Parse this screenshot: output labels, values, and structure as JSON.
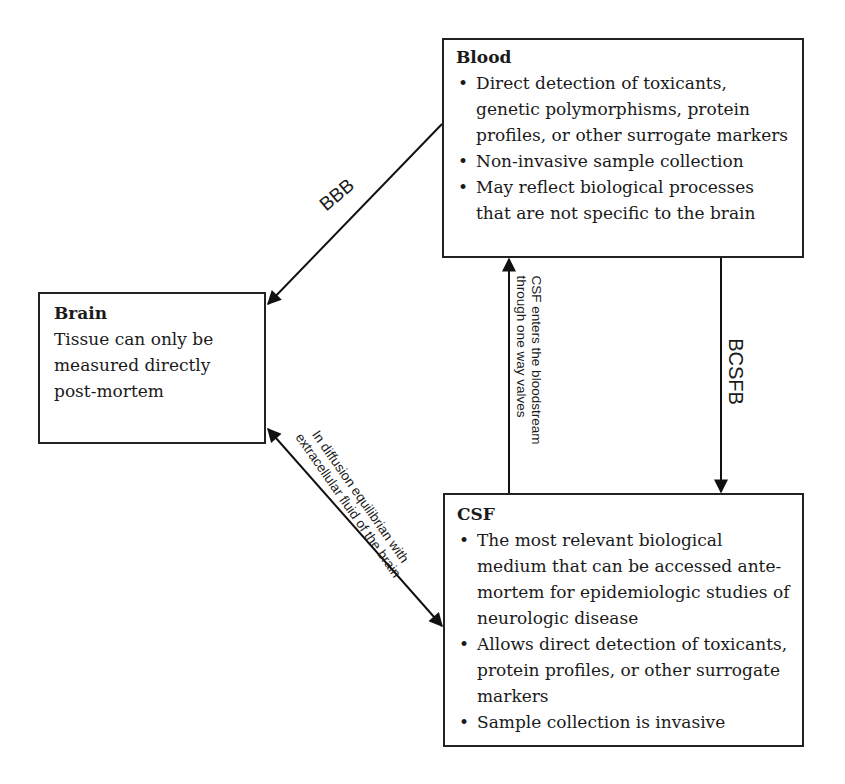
{
  "nodes": {
    "blood": {
      "title": "Blood",
      "bullets": [
        "Direct detection of toxicants, genetic polymorphisms, protein profiles, or other surrogate markers",
        "Non-invasive sample collection",
        "May reflect biological processes that are not specific to the brain"
      ]
    },
    "brain": {
      "title": "Brain",
      "description": "Tissue can only be measured directly post-mortem"
    },
    "csf": {
      "title": "CSF",
      "bullets": [
        "The most relevant biological medium that can be accessed ante-mortem for epidemiologic studies of neurologic disease",
        "Allows direct detection of toxicants, protein profiles, or other surrogate markers",
        "Sample collection is invasive"
      ]
    }
  },
  "edges": {
    "bbb": {
      "from": "blood",
      "to": "brain",
      "label": "BBB",
      "direction": "one-way"
    },
    "bcsfb": {
      "from": "blood",
      "to": "csf",
      "label": "BCSFB",
      "direction": "one-way"
    },
    "csf_to_blood": {
      "from": "csf",
      "to": "blood",
      "label_line1": "CSF enters the bloodstream",
      "label_line2": "through one way valves",
      "direction": "one-way"
    },
    "brain_csf": {
      "from": "brain",
      "to": "csf",
      "label_line1": "In diffusion equilibrian with",
      "label_line2": "extracellular fluid of the brain",
      "direction": "two-way"
    }
  }
}
